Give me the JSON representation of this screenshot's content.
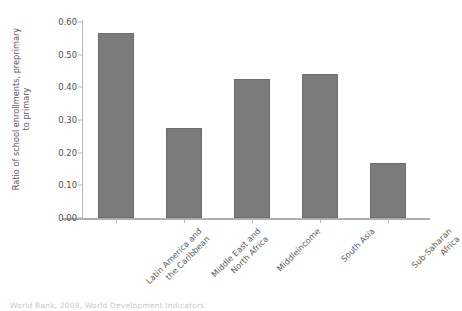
{
  "chart_data": {
    "type": "bar",
    "title": "",
    "xlabel": "",
    "ylabel_line1": "Ratio of school enrollments, preprimary",
    "ylabel_line2": "to primary",
    "ylabel": "Ratio of school enrollments, preprimary to primary",
    "categories": [
      "Latin America and the Caribbean",
      "Middle East and North Africa",
      "Middleincome",
      "South Asia",
      "Sub-Saharan Africa"
    ],
    "category_lines": [
      [
        "Latin America and",
        "the Caribbean"
      ],
      [
        "Middle East and",
        "North Africa"
      ],
      [
        "Middleincome"
      ],
      [
        "South Asia"
      ],
      [
        "Sub-Saharan",
        "Africa"
      ]
    ],
    "values": [
      0.565,
      0.277,
      0.425,
      0.44,
      0.168
    ],
    "ylim": [
      0.0,
      0.6
    ],
    "ytick_values": [
      0.0,
      0.1,
      0.2,
      0.3,
      0.4,
      0.5,
      0.6
    ],
    "ytick_labels": [
      "0.00",
      "0.10",
      "0.20",
      "0.30",
      "0.40",
      "0.50",
      "0.60"
    ],
    "grid": false,
    "legend": "none",
    "bar_color": "#7b7b7b",
    "axis_color": "#b7b7b7",
    "text_color": "#58585a",
    "background": "#ffffff"
  },
  "caption": {
    "text": "World Bank, 2009, World Development Indicators"
  }
}
